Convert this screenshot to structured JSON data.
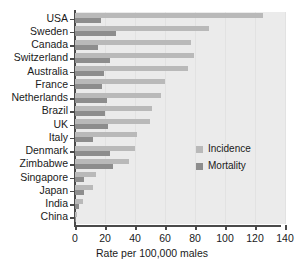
{
  "chart_data": {
    "type": "bar",
    "orientation": "horizontal",
    "title": "",
    "xlabel": "Rate per 100,000 males",
    "ylabel": "",
    "xlim": [
      0,
      140
    ],
    "xticks": [
      0,
      20,
      40,
      60,
      80,
      100,
      120,
      140
    ],
    "grid": true,
    "legend_position": "center-right",
    "categories": [
      "USA",
      "Sweden",
      "Canada",
      "Switzerland",
      "Australia",
      "France",
      "Netherlands",
      "Brazil",
      "UK",
      "Italy",
      "Denmark",
      "Zimbabwe",
      "Singapore",
      "Japan",
      "India",
      "China"
    ],
    "series": [
      {
        "name": "Incidence",
        "color": "#b9b9b9",
        "values": [
          125,
          89,
          77,
          79,
          75,
          60,
          57,
          51,
          50,
          41,
          40,
          36,
          14,
          12,
          5,
          1.5
        ]
      },
      {
        "name": "Mortality",
        "color": "#8d8d8d",
        "values": [
          17,
          27,
          15,
          23,
          19,
          18,
          21,
          20,
          22,
          12,
          23,
          25,
          6,
          6,
          2.5,
          0.8
        ]
      }
    ]
  },
  "legend": {
    "entries": [
      {
        "label": "Incidence",
        "color": "#b9b9b9"
      },
      {
        "label": "Mortality",
        "color": "#8d8d8d"
      }
    ]
  },
  "axis": {
    "x_title": "Rate per 100,000 males"
  }
}
